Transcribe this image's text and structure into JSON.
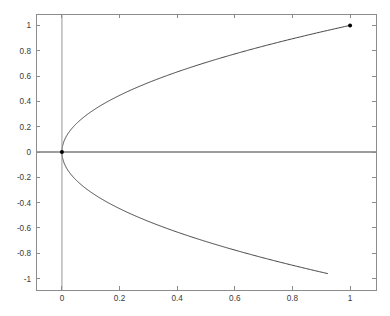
{
  "chart_data": {
    "type": "line",
    "title": "",
    "subtitle": "",
    "xlabel": "",
    "ylabel": "",
    "xlim": [
      -0.09,
      1.09
    ],
    "ylim": [
      -1.09,
      1.09
    ],
    "grid": false,
    "legend": null,
    "legend_position": "none",
    "background_color": "#ffffff",
    "box_color": "#8c8c8c",
    "axis_line_color": "#3a3a3a",
    "curve_color": "#2b2b2b",
    "marker_color": "#000000",
    "x_ticks": [
      0,
      0.2,
      0.4,
      0.6,
      0.8,
      1
    ],
    "x_tick_labels": [
      "0",
      "0.2",
      "0.4",
      "0.6",
      "0.8",
      "1"
    ],
    "y_ticks": [
      -1,
      -0.8,
      -0.6,
      -0.4,
      -0.2,
      0,
      0.2,
      0.4,
      0.6,
      0.8,
      1
    ],
    "y_tick_labels": [
      "-1",
      "-0.8",
      "-0.6",
      "-0.4",
      "-0.2",
      "0",
      "0.2",
      "0.4",
      "0.6",
      "0.8",
      "1"
    ],
    "series": [
      {
        "name": "upper-branch",
        "equation": "y = sqrt(x)",
        "x": [
          0,
          0.0025,
          0.01,
          0.0225,
          0.04,
          0.0625,
          0.09,
          0.1225,
          0.16,
          0.2025,
          0.25,
          0.3025,
          0.36,
          0.4225,
          0.49,
          0.5625,
          0.64,
          0.7225,
          0.81,
          0.9025,
          1
        ],
        "y": [
          0,
          0.05,
          0.1,
          0.15,
          0.2,
          0.25,
          0.3,
          0.35,
          0.4,
          0.45,
          0.5,
          0.55,
          0.6,
          0.65,
          0.7,
          0.75,
          0.8,
          0.85,
          0.9,
          0.95,
          1
        ]
      },
      {
        "name": "lower-branch",
        "equation": "y = -sqrt(x)",
        "x": [
          0,
          0.0025,
          0.01,
          0.0225,
          0.04,
          0.0625,
          0.09,
          0.1225,
          0.16,
          0.2025,
          0.25,
          0.3025,
          0.36,
          0.4225,
          0.49,
          0.5625,
          0.64,
          0.7225,
          0.81,
          0.9025,
          0.9216
        ],
        "y": [
          0,
          -0.05,
          -0.1,
          -0.15,
          -0.2,
          -0.25,
          -0.3,
          -0.35,
          -0.4,
          -0.45,
          -0.5,
          -0.55,
          -0.6,
          -0.65,
          -0.7,
          -0.75,
          -0.8,
          -0.85,
          -0.9,
          -0.95,
          -0.96
        ]
      }
    ],
    "markers": [
      {
        "name": "origin-marker",
        "x": 0,
        "y": 0,
        "shape": "dot",
        "size": 4
      },
      {
        "name": "endpoint-marker",
        "x": 1,
        "y": 1,
        "shape": "dot",
        "size": 4
      }
    ],
    "reference_lines": [
      {
        "name": "x-axis-zero-line",
        "orientation": "horizontal",
        "value": 0
      },
      {
        "name": "y-axis-zero-line",
        "orientation": "vertical",
        "value": 0
      }
    ]
  }
}
